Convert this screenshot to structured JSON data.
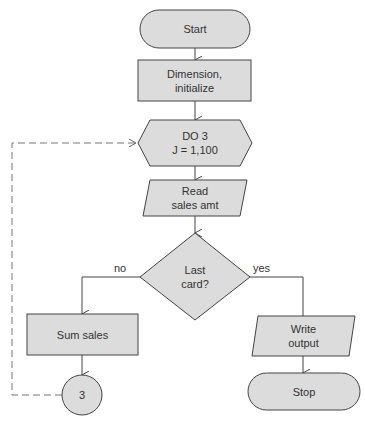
{
  "diagram": {
    "type": "flowchart",
    "colors": {
      "fill": "#dcdcdc",
      "stroke": "#444444",
      "text": "#333333",
      "loop_line": "#777777"
    },
    "nodes": {
      "start": {
        "shape": "terminal",
        "label": "Start"
      },
      "init": {
        "shape": "process",
        "label": "Dimension,\ninitialize"
      },
      "loop": {
        "shape": "preparation",
        "label": "DO 3\nJ = 1,100"
      },
      "read": {
        "shape": "input-output",
        "label": "Read\nsales amt"
      },
      "decision": {
        "shape": "decision",
        "label": "Last\ncard?"
      },
      "sum": {
        "shape": "process",
        "label": "Sum sales"
      },
      "connector": {
        "shape": "connector",
        "label": "3"
      },
      "write": {
        "shape": "input-output",
        "label": "Write\noutput"
      },
      "stop": {
        "shape": "terminal",
        "label": "Stop"
      }
    },
    "edges": {
      "no": "no",
      "yes": "yes"
    }
  }
}
